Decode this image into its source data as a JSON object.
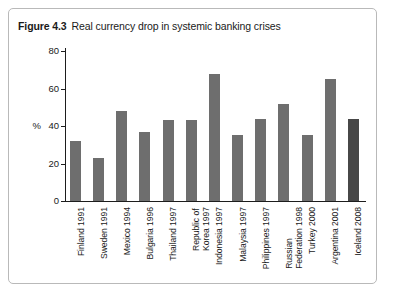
{
  "figure": {
    "number": "Figure 4.3",
    "title": "Real currency drop in systemic banking crises"
  },
  "chart_data": {
    "type": "bar",
    "title": "Real currency drop in systemic banking crises",
    "xlabel": "",
    "ylabel": "%",
    "ylim": [
      0,
      80
    ],
    "yticks": [
      "0",
      "20",
      "40",
      "60",
      "80"
    ],
    "grid": false,
    "legend": false,
    "categories": [
      "Finland 1991",
      "Sweden 1991",
      "Mexico 1994",
      "Bulgaria 1996",
      "Thailand 1997",
      "Republic of Korea 1997",
      "Indonesia 1997",
      "Malaysia 1997",
      "Philippines 1997",
      "Russian Federation 1998",
      "Turkey 2000",
      "Argentina 2001",
      "Iceland 2008"
    ],
    "category_lines": [
      [
        "Finland 1991"
      ],
      [
        "Sweden 1991"
      ],
      [
        "Mexico 1994"
      ],
      [
        "Bulgaria 1996"
      ],
      [
        "Thailand 1997"
      ],
      [
        "Republic of",
        "Korea 1997"
      ],
      [
        "Indonesia 1997"
      ],
      [
        "Malaysia 1997"
      ],
      [
        "Philippines 1997"
      ],
      [
        "Russian",
        "Federation 1998"
      ],
      [
        "Turkey 2000"
      ],
      [
        "Argentina 2001"
      ],
      [
        "Iceland 2008"
      ]
    ],
    "values": [
      32,
      23,
      48,
      37,
      43,
      43,
      68,
      35,
      44,
      52,
      35,
      65,
      44
    ],
    "bar_colors": [
      "#6e6e6e",
      "#6e6e6e",
      "#6e6e6e",
      "#6e6e6e",
      "#6e6e6e",
      "#6e6e6e",
      "#6e6e6e",
      "#6e6e6e",
      "#6e6e6e",
      "#6e6e6e",
      "#6e6e6e",
      "#6e6e6e",
      "#474747"
    ]
  },
  "colors": {
    "bar": "#6e6e6e",
    "bar_highlight": "#474747",
    "axis": "#1d1d1d",
    "frame": "#b9b9b9",
    "background": "#ffffff"
  }
}
